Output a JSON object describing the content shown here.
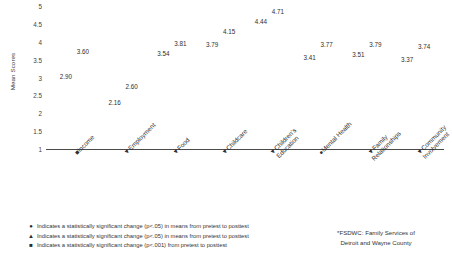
{
  "chart_data": {
    "type": "bar",
    "title": "",
    "subtitle": "",
    "xlabel": "",
    "ylabel": "Mean Scores",
    "ylim": [
      1,
      5
    ],
    "yticks": [
      "5",
      "4.5",
      "4",
      "3.5",
      "3",
      "2.5",
      "2",
      "1.5",
      "1"
    ],
    "grid": false,
    "legend_position": "below",
    "categories": [
      "Income",
      "Employment",
      "Food",
      "Childcare",
      "Children's Education",
      "Mental Health",
      "Family Relationships",
      "Community Involvement"
    ],
    "category_lines": [
      [
        "Income"
      ],
      [
        "Employment"
      ],
      [
        "Food"
      ],
      [
        "Childcare"
      ],
      [
        "Children's",
        "Education"
      ],
      [
        "Mental Health"
      ],
      [
        "Family",
        "Relationships"
      ],
      [
        "Community",
        "Involvement"
      ]
    ],
    "category_markers": [
      "■",
      "▼",
      "▼",
      "▼",
      "▼",
      "●",
      "▼",
      "▼"
    ],
    "series": [
      {
        "name": "Pretest",
        "color": "#59595b",
        "values": [
          2.9,
          2.16,
          3.54,
          3.79,
          4.44,
          3.41,
          3.51,
          3.37
        ],
        "labels": [
          "2.90",
          "2.16",
          "3.54",
          "3.79",
          "4.44",
          "3.41",
          "3.51",
          "3.37"
        ]
      },
      {
        "name": "Posttest",
        "color": "#9a9a9c",
        "values": [
          3.6,
          2.6,
          3.81,
          4.15,
          4.71,
          3.77,
          3.79,
          3.74
        ],
        "labels": [
          "3.60",
          "2.60",
          "3.81",
          "4.15",
          "4.71",
          "3.77",
          "3.79",
          "3.74"
        ]
      }
    ]
  },
  "legend": {
    "items": [
      {
        "marker": "●",
        "text": "Indicates a statistically significant change (p<.05) in means from pretest to posttest"
      },
      {
        "marker": "▲",
        "text": "Indicates a statistically significant change (p<.05) in means from pretest to posttest"
      },
      {
        "marker": "■",
        "text": "Indicates a statistically significant change (p<.001) from pretest to posttest"
      }
    ]
  },
  "footnote": {
    "line1": "*FSDWC: Family Services of",
    "line2": "Detroit and Wayne County"
  }
}
